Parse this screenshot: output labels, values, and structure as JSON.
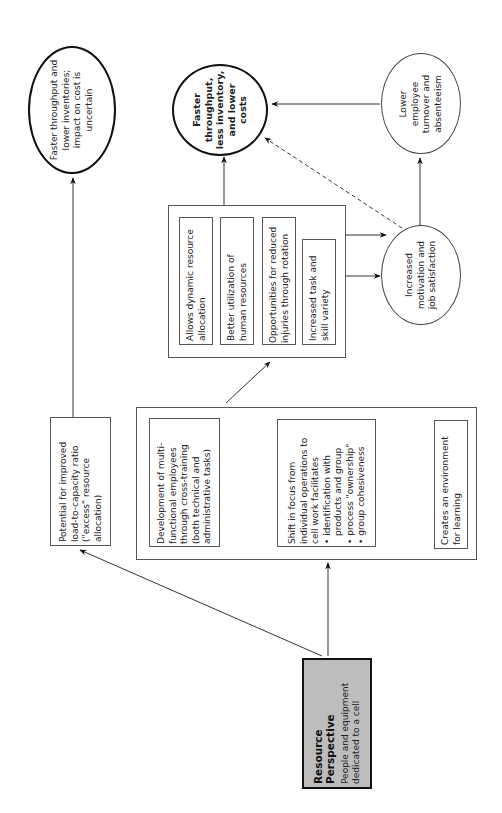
{
  "diagram": {
    "orientation": "rotated -90deg (text reads bottom-to-top)",
    "source": {
      "title": "Resource Perspective",
      "subtitle": "People and equipment dedicated to a cell",
      "fill": "#bdbdbd"
    },
    "potential_box": {
      "text": "Potential for improved load-to-capacity ratio (\"excess\" resource allocation)"
    },
    "outcome_left": {
      "text": "Faster throughput and lower inventories; impact on cost is uncertain"
    },
    "group_box": {
      "items": [
        {
          "text": "Development of multi-functional employees through cross-training (both technical and administrative tasks)"
        },
        {
          "text": "Shift in focus from individual operations to cell work facilitates",
          "bullets": [
            "identification with products and group",
            "process \"ownership\"",
            "group cohesiveness"
          ]
        },
        {
          "text": "Creates an environment for learning"
        }
      ]
    },
    "benefits_box": {
      "items": [
        {
          "text": "Allows dynamic resource allocation"
        },
        {
          "text": "Better utilization of human resources"
        },
        {
          "text": "Opportunities for reduced injuries through rotation"
        },
        {
          "text": "Increased task and skill variety"
        }
      ]
    },
    "motivation": {
      "text": "Increased motivation and job satisfaction"
    },
    "turnover": {
      "text": "Lower employee turnover and absenteeism"
    },
    "outcome_main": {
      "text": "Faster throughput, less inventory, and lower costs"
    }
  }
}
